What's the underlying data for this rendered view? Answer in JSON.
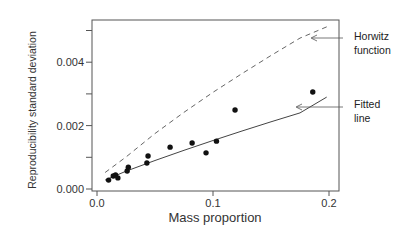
{
  "chart_data": {
    "type": "scatter",
    "title": "",
    "xlabel": "Mass proportion",
    "ylabel": "Reproducibility standard deviation",
    "xlim": [
      0.0,
      0.21
    ],
    "ylim": [
      0.0,
      0.0053
    ],
    "grid": false,
    "legend": null,
    "x_ticks": [
      0.0,
      0.1,
      0.2
    ],
    "x_tick_labels": [
      "0.0",
      "0.1",
      "0.2"
    ],
    "y_ticks": [
      0.0,
      0.001,
      0.002,
      0.003,
      0.004,
      0.005
    ],
    "y_tick_labels": [
      "0.000",
      "",
      "0.002",
      "",
      "0.004",
      ""
    ],
    "series": [
      {
        "name": "Observed",
        "kind": "scatter",
        "marker": "filled-circle",
        "color": "#111111",
        "x": [
          0.01,
          0.014,
          0.016,
          0.018,
          0.026,
          0.027,
          0.043,
          0.044,
          0.063,
          0.082,
          0.094,
          0.103,
          0.119,
          0.186
        ],
        "y": [
          0.00028,
          0.00041,
          0.00044,
          0.00035,
          0.00057,
          0.00069,
          0.00082,
          0.00104,
          0.00132,
          0.00145,
          0.00114,
          0.00151,
          0.00249,
          0.00306
        ]
      },
      {
        "name": "Horwitz function",
        "kind": "line",
        "style": "dashed",
        "color": "#666666",
        "x": [
          0.007,
          0.025,
          0.05,
          0.075,
          0.1,
          0.125,
          0.15,
          0.175,
          0.199
        ],
        "y": [
          0.00052,
          0.00101,
          0.00175,
          0.00242,
          0.00305,
          0.00364,
          0.00421,
          0.00476,
          0.00513
        ]
      },
      {
        "name": "Fitted line",
        "kind": "line",
        "style": "solid",
        "color": "#444444",
        "x": [
          0.007,
          0.025,
          0.05,
          0.075,
          0.1,
          0.125,
          0.15,
          0.175,
          0.198
        ],
        "y": [
          0.00028,
          0.00056,
          0.0009,
          0.00122,
          0.00153,
          0.00183,
          0.00212,
          0.0024,
          0.0029
        ]
      }
    ],
    "annotations": [
      {
        "text_lines": [
          "Horwitz",
          "function"
        ],
        "points_to": "Horwitz function",
        "arrow": true
      },
      {
        "text_lines": [
          "Fitted",
          "line"
        ],
        "points_to": "Fitted line",
        "arrow": true
      }
    ]
  }
}
